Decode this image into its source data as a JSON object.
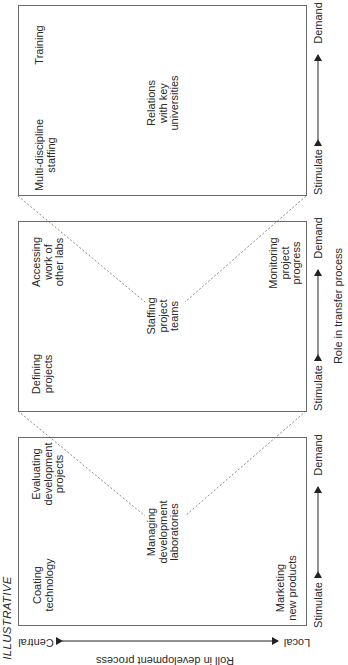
{
  "figure": {
    "tag": "ILLUSTRATIVE",
    "x_axis": {
      "title": "Role in transfer process",
      "left_label": "Stimulate",
      "right_label": "Demand"
    },
    "y_axis": {
      "title": "Roll in development process",
      "top_label": "Central",
      "bottom_label": "Local"
    },
    "panels": [
      {
        "name": "panel-development",
        "items": {
          "top_left": "Coating\ntechnology",
          "top_right": "Evaluating\ndevelopment\nprojects",
          "center": "Managing\ndevelopment\nlaboratories",
          "bottom_left": "Marketing\nnew products"
        },
        "stimulate": "Stimulate",
        "demand": "Demand"
      },
      {
        "name": "panel-projects",
        "items": {
          "top_left": "Defining\nprojects",
          "top_right": "Accessing\nwork of\nother labs",
          "center": "Staffing\nproject\nteams",
          "bottom_right": "Monitoring\nproject\nprogress"
        },
        "stimulate": "Stimulate",
        "demand": "Demand"
      },
      {
        "name": "panel-staffing",
        "items": {
          "top_left": "Multi-discipline\nstaffing",
          "top_right": "Training",
          "center": "Relations\nwith key\nuniversities"
        },
        "stimulate": "Stimulate",
        "demand": "Demand"
      }
    ],
    "colors": {
      "box_border": "#6a6a6a",
      "text": "#2a2a2a",
      "dashed_line": "#8a8a8a"
    }
  }
}
